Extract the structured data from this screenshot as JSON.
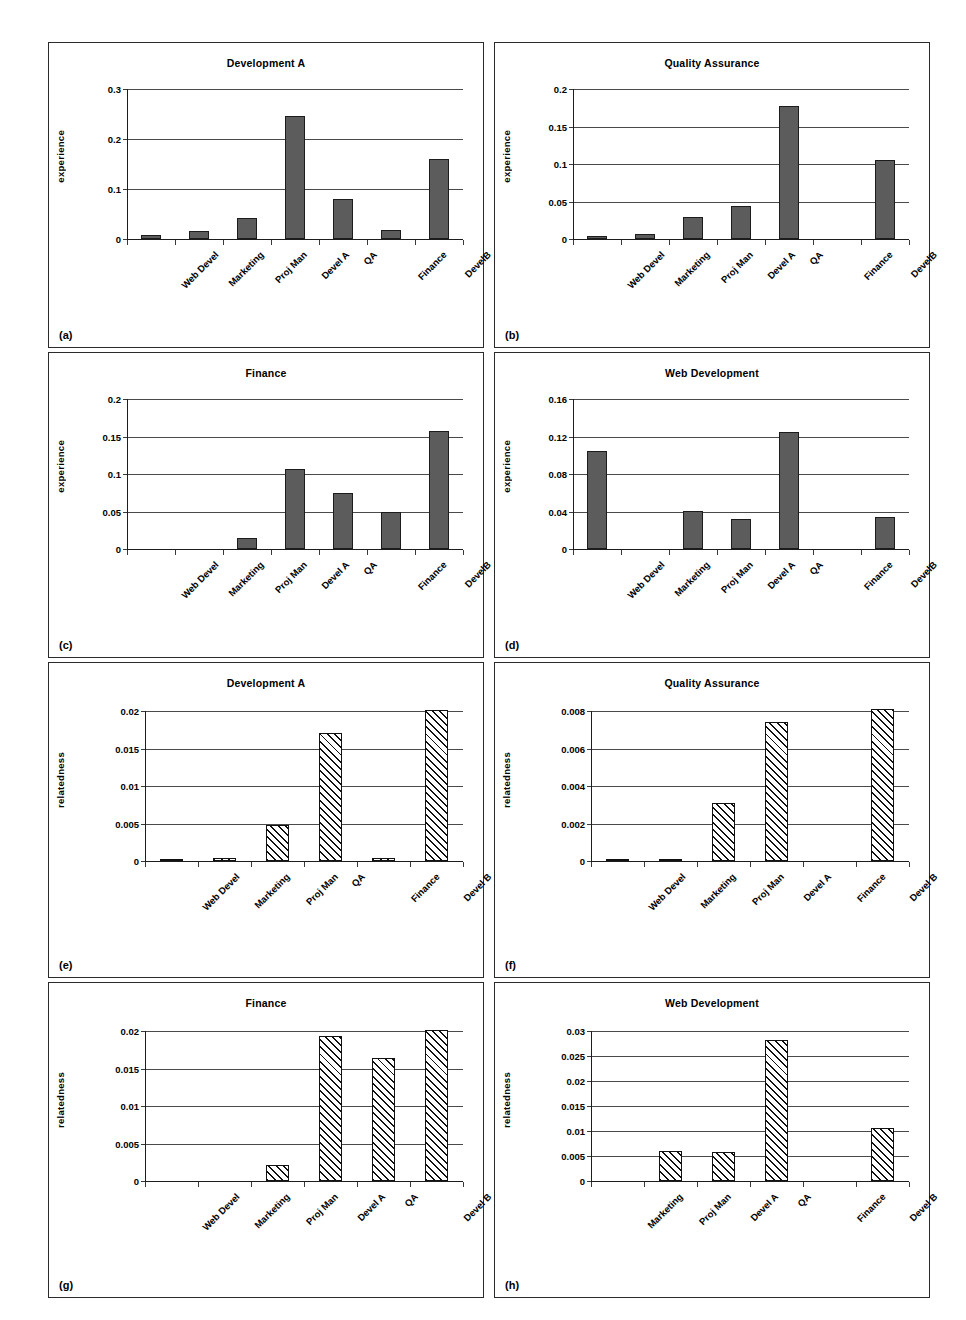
{
  "figure": {
    "panel_count": 8,
    "bar_fill_solid": "#5c5c5c",
    "bar_fill_hatch": "diagonal-hatch",
    "axis_color": "#1d1d1d"
  },
  "chart_data": [
    {
      "type": "bar",
      "tag": "(a)",
      "title": "Development A",
      "xlabel": "",
      "ylabel": "experience",
      "categories": [
        "Web Devel",
        "Marketing",
        "Proj Man",
        "Devel A",
        "QA",
        "Finance",
        "DevelB"
      ],
      "values": [
        0.009,
        0.017,
        0.042,
        0.247,
        0.08,
        0.018,
        0.161
      ],
      "ylim": [
        0,
        0.3
      ],
      "yticks": [
        0,
        0.1,
        0.2,
        0.3
      ],
      "ytick_labels": [
        "0",
        "0.1",
        "0.2",
        "0.3"
      ],
      "grid": true,
      "style": "solid"
    },
    {
      "type": "bar",
      "tag": "(b)",
      "title": "Quality Assurance",
      "xlabel": "",
      "ylabel": "experience",
      "categories": [
        "Web Devel",
        "Marketing",
        "Proj Man",
        "Devel A",
        "QA",
        "Finance",
        "DevelB"
      ],
      "values": [
        0.004,
        0.007,
        0.029,
        0.044,
        0.178,
        0.0,
        0.105
      ],
      "ylim": [
        0,
        0.2
      ],
      "yticks": [
        0,
        0.05,
        0.1,
        0.15,
        0.2
      ],
      "ytick_labels": [
        "0",
        "0.05",
        "0.1",
        "0.15",
        "0.2"
      ],
      "grid": true,
      "style": "solid"
    },
    {
      "type": "bar",
      "tag": "(c)",
      "title": "Finance",
      "xlabel": "",
      "ylabel": "experience",
      "categories": [
        "Web Devel",
        "Marketing",
        "Proj Man",
        "Devel A",
        "QA",
        "Finance",
        "DevelB"
      ],
      "values": [
        0.0,
        0.0,
        0.015,
        0.107,
        0.075,
        0.05,
        0.157
      ],
      "ylim": [
        0,
        0.2
      ],
      "yticks": [
        0,
        0.05,
        0.1,
        0.15,
        0.2
      ],
      "ytick_labels": [
        "0",
        "0.05",
        "0.1",
        "0.15",
        "0.2"
      ],
      "grid": true,
      "style": "solid"
    },
    {
      "type": "bar",
      "tag": "(d)",
      "title": "Web Development",
      "xlabel": "",
      "ylabel": "experience",
      "categories": [
        "Web Devel",
        "Marketing",
        "Proj Man",
        "Devel A",
        "QA",
        "Finance",
        "DevelB"
      ],
      "values": [
        0.105,
        0.0,
        0.041,
        0.032,
        0.125,
        0.0,
        0.034
      ],
      "ylim": [
        0,
        0.16
      ],
      "yticks": [
        0,
        0.04,
        0.08,
        0.12,
        0.16
      ],
      "ytick_labels": [
        "0",
        "0.04",
        "0.08",
        "0.12",
        "0.16"
      ],
      "grid": true,
      "style": "solid"
    },
    {
      "type": "bar",
      "tag": "(e)",
      "title": "Development A",
      "xlabel": "",
      "ylabel": "relatedness",
      "categories": [
        "Web Devel",
        "Marketing",
        "Proj Man",
        "QA",
        "Finance",
        "Devel B"
      ],
      "values": [
        0.0002,
        0.0004,
        0.0048,
        0.0171,
        0.0004,
        0.0201
      ],
      "ylim": [
        0,
        0.02
      ],
      "yticks": [
        0,
        0.005,
        0.01,
        0.015,
        0.02
      ],
      "ytick_labels": [
        "0",
        "0.005",
        "0.01",
        "0.015",
        "0.02"
      ],
      "grid": true,
      "style": "hatch"
    },
    {
      "type": "bar",
      "tag": "(f)",
      "title": "Quality Assurance",
      "xlabel": "",
      "ylabel": "relatedness",
      "categories": [
        "Web Devel",
        "Marketing",
        "Proj Man",
        "Devel A",
        "Finance",
        "Devel B"
      ],
      "values": [
        0.0001,
        0.0001,
        0.0031,
        0.0074,
        0.0,
        0.0081
      ],
      "ylim": [
        0,
        0.008
      ],
      "yticks": [
        0,
        0.002,
        0.004,
        0.006,
        0.008
      ],
      "ytick_labels": [
        "0",
        "0.002",
        "0.004",
        "0.006",
        "0.008"
      ],
      "grid": true,
      "style": "hatch"
    },
    {
      "type": "bar",
      "tag": "(g)",
      "title": "Finance",
      "xlabel": "",
      "ylabel": "relatedness",
      "categories": [
        "Web Devel",
        "Marketing",
        "Proj Man",
        "Devel A",
        "QA",
        "Devel B"
      ],
      "values": [
        0.0,
        0.0,
        0.0022,
        0.0194,
        0.0164,
        0.0201
      ],
      "ylim": [
        0,
        0.02
      ],
      "yticks": [
        0,
        0.005,
        0.01,
        0.015,
        0.02
      ],
      "ytick_labels": [
        "0",
        "0.005",
        "0.01",
        "0.015",
        "0.02"
      ],
      "grid": true,
      "style": "hatch"
    },
    {
      "type": "bar",
      "tag": "(h)",
      "title": "Web Development",
      "xlabel": "",
      "ylabel": "relatedness",
      "categories": [
        "Marketing",
        "Proj Man",
        "Devel A",
        "QA",
        "Finance",
        "Devel B"
      ],
      "values": [
        0.0,
        0.0061,
        0.0059,
        0.0282,
        0.0,
        0.0106
      ],
      "ylim": [
        0,
        0.03
      ],
      "yticks": [
        0,
        0.005,
        0.01,
        0.015,
        0.02,
        0.025,
        0.03
      ],
      "ytick_labels": [
        "0",
        "0.005",
        "0.01",
        "0.015",
        "0.02",
        "0.025",
        "0.03"
      ],
      "grid": true,
      "style": "hatch"
    }
  ]
}
